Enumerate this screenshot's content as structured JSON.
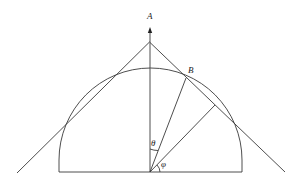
{
  "diagram": {
    "type": "geometric-figure",
    "labels": {
      "point_a": "A",
      "point_b": "B",
      "angle_theta": "θ",
      "angle_phi": "φ"
    },
    "colors": {
      "line": "#3a3a3a",
      "text": "#222222",
      "background": "#ffffff"
    }
  }
}
